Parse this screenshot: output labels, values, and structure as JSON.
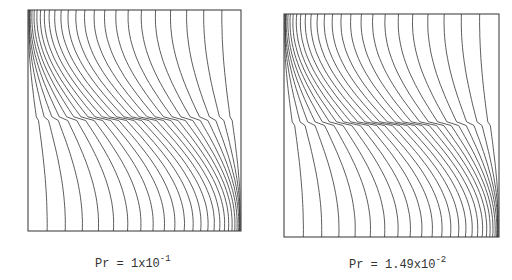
{
  "figure": {
    "panels": [
      {
        "id": "left",
        "caption_prefix": "Pr = 1x10",
        "caption_exponent": "-1",
        "box": {
          "x": 28,
          "y": 10,
          "w": 213,
          "h": 221
        },
        "n_contours": 26,
        "skew": 0.62
      },
      {
        "id": "right",
        "caption_prefix": "Pr = 1.49x10",
        "caption_exponent": "-2",
        "box": {
          "x": 284,
          "y": 14,
          "w": 215,
          "h": 223
        },
        "n_contours": 26,
        "skew": 0.72
      }
    ],
    "line_color": "#333333"
  }
}
